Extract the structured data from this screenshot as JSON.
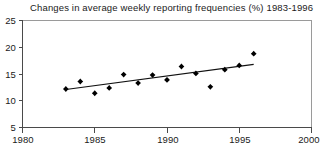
{
  "chart_data": {
    "type": "scatter",
    "title": "Changes in average weekly reporting frequencies (%) 1983-1996",
    "xlabel": "",
    "ylabel": "",
    "xlim": [
      1980,
      2000
    ],
    "ylim": [
      5,
      25
    ],
    "xticks": [
      1980,
      1985,
      1990,
      1995,
      2000
    ],
    "yticks": [
      5,
      10,
      15,
      20,
      25
    ],
    "grid": false,
    "legend": null,
    "series": [
      {
        "name": "Average weekly reporting frequency",
        "marker": "filled-diamond",
        "color": "#000000",
        "x": [
          1983,
          1984,
          1985,
          1986,
          1987,
          1988,
          1989,
          1990,
          1991,
          1992,
          1993,
          1994,
          1995,
          1996
        ],
        "values": [
          12.2,
          13.6,
          11.4,
          12.4,
          14.9,
          13.3,
          14.8,
          13.9,
          16.4,
          15.1,
          12.6,
          15.8,
          16.6,
          18.8
        ]
      },
      {
        "name": "Linear trend line",
        "type": "line",
        "color": "#111111",
        "x": [
          1983,
          1996
        ],
        "values": [
          12.1,
          16.8
        ]
      }
    ]
  },
  "axis": {
    "x_tick_labels": [
      "1980",
      "1985",
      "1990",
      "1995",
      "2000"
    ],
    "y_tick_labels": [
      "5",
      "10",
      "15",
      "20",
      "25"
    ]
  }
}
